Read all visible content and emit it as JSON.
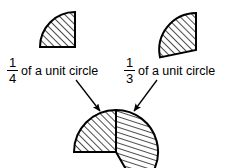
{
  "figure": {
    "background_color": "#ffffff",
    "ink_color": "#000000",
    "hatch_color": "#000000",
    "width": 232,
    "height": 168
  },
  "labels": {
    "quarter": {
      "numerator": "1",
      "denominator": "4",
      "text": "of a unit circle",
      "full": "1/4 of a unit circle"
    },
    "third": {
      "numerator": "1",
      "denominator": "3",
      "text": "of a unit circle",
      "full": "1/3 of a unit circle"
    }
  },
  "shapes": {
    "quarter_circle": {
      "name": "quarter-circle-sector",
      "fraction": "1/4",
      "angle_degrees": 90,
      "center": [
        75,
        47
      ],
      "radius": 35,
      "hatch_direction": "up-right"
    },
    "third_circle": {
      "name": "third-circle-sector",
      "fraction": "1/3",
      "angle_degrees": 120,
      "center": [
        165,
        47
      ],
      "radius": 37,
      "hatch_direction": "up-right"
    },
    "combined": {
      "name": "combined-sector-figure",
      "fraction_total": "7/12",
      "center": [
        116,
        152
      ],
      "radius": 42,
      "left_part_fraction": "1/4",
      "right_part_fraction": "1/3"
    }
  },
  "arrows": {
    "left": {
      "name": "arrow-quarter-to-combined",
      "from": [
        76,
        80
      ],
      "to": [
        101,
        112
      ]
    },
    "right": {
      "name": "arrow-third-to-combined",
      "from": [
        157,
        80
      ],
      "to": [
        133,
        112
      ]
    }
  }
}
